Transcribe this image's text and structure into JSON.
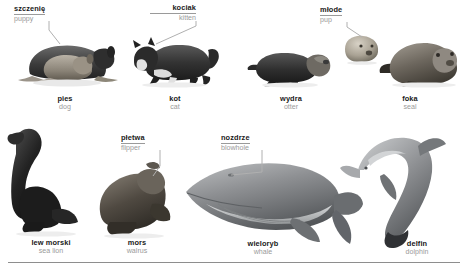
{
  "page": {
    "language_primary": "Polish",
    "language_secondary": "English",
    "text_color_primary": "#1a1a1a",
    "text_color_secondary": "#9a9a9a",
    "background": "#ffffff",
    "leader_line_color": "#b0b0b0",
    "baseline_rule_color": "#8e8e8e"
  },
  "callouts": [
    {
      "id": "puppy",
      "pl": "szczenię",
      "en": "puppy",
      "align": "left",
      "points_to": "dog"
    },
    {
      "id": "kitten",
      "pl": "kociak",
      "en": "kitten",
      "align": "right",
      "points_to": "cat"
    },
    {
      "id": "pup",
      "pl": "młode",
      "en": "pup",
      "align": "left",
      "points_to": "seal"
    },
    {
      "id": "flipper",
      "pl": "płetwa",
      "en": "flipper",
      "align": "left",
      "points_to": "walrus"
    },
    {
      "id": "blowhole",
      "pl": "nozdrze",
      "en": "blowhole",
      "align": "left",
      "points_to": "whale"
    }
  ],
  "figures": [
    {
      "id": "dog",
      "pl": "pies",
      "en": "dog",
      "row": 1
    },
    {
      "id": "cat",
      "pl": "kot",
      "en": "cat",
      "row": 1
    },
    {
      "id": "otter",
      "pl": "wydra",
      "en": "otter",
      "row": 1
    },
    {
      "id": "seal",
      "pl": "foka",
      "en": "seal",
      "row": 1
    },
    {
      "id": "sealion",
      "pl": "lew morski",
      "en": "sea lion",
      "row": 2
    },
    {
      "id": "walrus",
      "pl": "mors",
      "en": "walrus",
      "row": 2
    },
    {
      "id": "whale",
      "pl": "wieloryb",
      "en": "whale",
      "row": 2
    },
    {
      "id": "dolphin",
      "pl": "delfin",
      "en": "dolphin",
      "row": 2
    }
  ]
}
